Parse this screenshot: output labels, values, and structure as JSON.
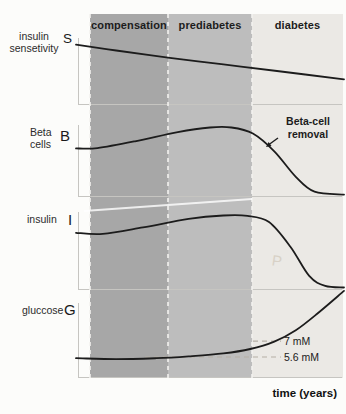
{
  "figure": {
    "phases": [
      {
        "label": "compensation",
        "color": "#a7a7a7"
      },
      {
        "label": "prediabetes",
        "color": "#bdbdbd"
      },
      {
        "label": "diabetes",
        "color": "#ebe9e5"
      }
    ],
    "phase_boundaries_x_norm": [
      0.05,
      0.34,
      0.66,
      1.0
    ],
    "x_axis_label": "time (years)",
    "panels": [
      {
        "id": "S",
        "side_label_lines": [
          "insulin",
          "sensetivity"
        ],
        "axis_letter": "S"
      },
      {
        "id": "B",
        "side_label_lines": [
          "Beta",
          "cells"
        ],
        "axis_letter": "B",
        "annotation": {
          "lines": [
            "Beta-cell",
            "removal"
          ]
        }
      },
      {
        "id": "I",
        "side_label_lines": [
          "insulin"
        ],
        "axis_letter": "I"
      },
      {
        "id": "G",
        "side_label_lines": [
          "gluccose"
        ],
        "axis_letter": "G",
        "thresholds": [
          {
            "label": "7 mM",
            "mM": 7.0
          },
          {
            "label": "5.6 mM",
            "mM": 5.6
          }
        ]
      }
    ],
    "artifacts": {
      "watermark": "P"
    },
    "colors": {
      "curve": "#1c1c1c",
      "axis": "#c6c5c1",
      "threshold_dash": "#b5afa5",
      "separator_dash": "#f3f2ef"
    }
  },
  "chart_data": [
    {
      "id": "S",
      "type": "line",
      "title": "insulin sensetivity",
      "xlabel": "time (years)",
      "x_note": "x normalized 0-1, axis unlabeled",
      "x": [
        0,
        0.15,
        0.35,
        0.55,
        0.75,
        1
      ],
      "y_rel": [
        0.9,
        0.81,
        0.7,
        0.6,
        0.5,
        0.375
      ],
      "trend": "declines steadily through compensation, prediabetes and diabetes"
    },
    {
      "id": "B",
      "type": "line",
      "title": "Beta cells",
      "xlabel": "time (years)",
      "x_note": "x normalized 0-1, axis unlabeled",
      "x": [
        0,
        0.08,
        0.22,
        0.38,
        0.5,
        0.58,
        0.66,
        0.74,
        0.82,
        0.89,
        1
      ],
      "y_rel": [
        0.67,
        0.675,
        0.77,
        0.9,
        0.965,
        0.965,
        0.88,
        0.63,
        0.27,
        0.06,
        0.02
      ],
      "trend": "rises to a peak in prediabetes then collapses in diabetes (Beta-cell removal)"
    },
    {
      "id": "I",
      "type": "line",
      "title": "insulin",
      "xlabel": "time (years)",
      "x_note": "x normalized 0-1, axis unlabeled",
      "x": [
        0,
        0.1,
        0.25,
        0.42,
        0.55,
        0.64,
        0.72,
        0.8,
        0.87,
        0.93,
        1
      ],
      "y_rel": [
        0.73,
        0.715,
        0.8,
        0.91,
        0.955,
        0.95,
        0.87,
        0.55,
        0.17,
        0.04,
        0.02
      ],
      "trend": "broad plateau peak through prediabetes, steep fall to near zero in diabetes"
    },
    {
      "id": "G",
      "type": "line",
      "title": "gluccose",
      "ylabel": "mM",
      "xlabel": "time (years)",
      "x_note": "x normalized 0-1, axis unlabeled",
      "x": [
        0,
        0.15,
        0.3,
        0.42,
        0.55,
        0.65,
        0.74,
        0.82,
        0.9,
        1
      ],
      "y_mM": [
        5.5,
        5.42,
        5.5,
        5.66,
        5.92,
        6.3,
        6.95,
        7.95,
        9.4,
        11.4
      ],
      "reference_lines_mM": [
        5.6,
        7.0
      ],
      "trend": "flat near 5.5 mM, crosses 5.6 mM in prediabetes, 7 mM at diabetes onset, then rises sharply"
    }
  ]
}
